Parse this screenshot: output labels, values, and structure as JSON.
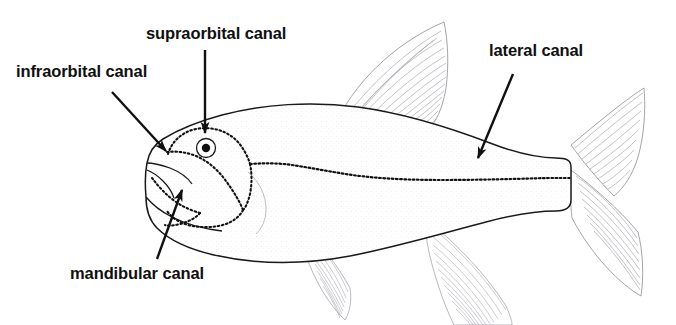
{
  "figure": {
    "view": "left lateral view",
    "style": "black and white line drawing with stippled body",
    "colors": {
      "background": "#ffffff",
      "ink": "#101010",
      "outline": "#1a1a1a",
      "fin_rays": "#8a8a90",
      "stipple": "#e9e9ec",
      "canal_dots": "#111111"
    },
    "labels": [
      {
        "id": "supraorbital",
        "text": "supraorbital canal",
        "text_x": 146,
        "text_y": 25,
        "leader": {
          "from_x": 205,
          "from_y": 50,
          "to_x": 205,
          "to_y": 133,
          "arrow": "down"
        }
      },
      {
        "id": "infraorbital",
        "text": "infraorbital canal",
        "text_x": 16,
        "text_y": 63,
        "leader": {
          "from_x": 112,
          "from_y": 92,
          "to_x": 167,
          "to_y": 152,
          "arrow": "down-right"
        }
      },
      {
        "id": "lateral",
        "text": "lateral canal",
        "text_x": 489,
        "text_y": 42,
        "leader": {
          "from_x": 513,
          "from_y": 74,
          "to_x": 477,
          "to_y": 159,
          "arrow": "down-left"
        }
      },
      {
        "id": "mandibular",
        "text": "mandibular canal",
        "text_x": 70,
        "text_y": 265,
        "leader": {
          "from_x": 157,
          "from_y": 259,
          "to_x": 183,
          "to_y": 189,
          "arrow": "up-right"
        }
      }
    ],
    "anatomy": {
      "eye": {
        "cx": 206,
        "cy": 148,
        "pupil_r": 4,
        "iris_r": 9
      },
      "canals": [
        {
          "name": "supraorbital canal",
          "description": "dotted arc over the top of the eye"
        },
        {
          "name": "infraorbital canal",
          "description": "dotted ring encircling the eye and cheek"
        },
        {
          "name": "mandibular canal",
          "description": "dotted line along the lower jaw"
        },
        {
          "name": "preopercular canal",
          "description": "dotted line along rear cheek margin"
        },
        {
          "name": "lateral canal",
          "description": "dotted line running the length of the flank to the tail"
        }
      ],
      "fins": [
        {
          "name": "dorsal fin",
          "rays": 16
        },
        {
          "name": "pectoral fin",
          "rays": 9
        },
        {
          "name": "pelvic fin",
          "rays": 10
        },
        {
          "name": "anal fin",
          "rays": 13
        },
        {
          "name": "caudal fin",
          "rays": 18,
          "shape": "forked"
        }
      ]
    }
  }
}
